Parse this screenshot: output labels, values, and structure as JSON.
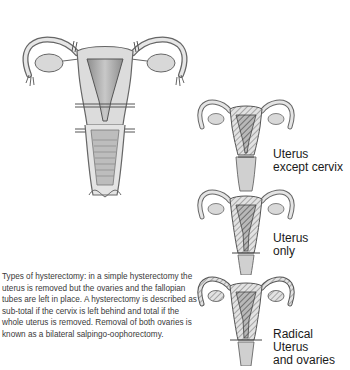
{
  "figure": {
    "title": "Types of hysterectomy",
    "main_illustration": {
      "name": "uterus-with-incision-lines"
    },
    "variants": [
      {
        "id": "subtotal",
        "label_lines": [
          "Uterus",
          "except cervix"
        ]
      },
      {
        "id": "total",
        "label_lines": [
          "Uterus",
          "only"
        ]
      },
      {
        "id": "radical",
        "label_lines": [
          "Radical",
          "Uterus",
          "and ovaries"
        ]
      }
    ],
    "caption": "Types of hysterectomy: in a simple hysterectomy the uterus is removed but the ovaries and the fallopian tubes are left in place. A hysterectomy is described as sub-total if the cervix is left behind and total if the whole uterus is removed. Removal of both ovaries is known as a bilateral salpingo-oophorectomy."
  },
  "colors": {
    "ink": "#555555",
    "fill": "#d6d6d6",
    "fill_dark": "#9a9a9a",
    "text": "#1a1a1a"
  }
}
